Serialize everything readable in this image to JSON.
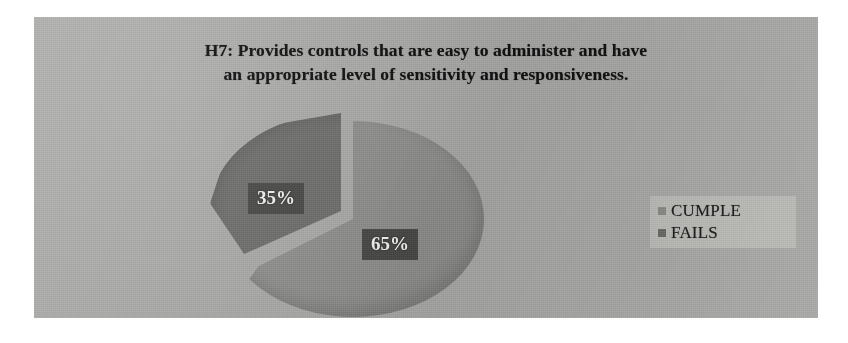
{
  "chart_data": {
    "type": "pie",
    "title": "H7: Provides controls that are easy to administer and have an appropriate level of sensitivity and responsiveness.",
    "title_line1": "H7: Provides controls that are easy to administer and have",
    "title_line2": "an appropriate level of sensitivity and responsiveness.",
    "categories": [
      "CUMPLE",
      "FAILS"
    ],
    "values": [
      65,
      35
    ],
    "value_labels": [
      "65%",
      "35%"
    ],
    "units": "percent",
    "legend": {
      "position": "right",
      "entries": [
        {
          "label": "CUMPLE",
          "color": "#8b8b89",
          "value": 65,
          "value_label": "65%"
        },
        {
          "label": "FAILS",
          "color": "#6b6b69",
          "value": 35,
          "value_label": "35%"
        }
      ]
    },
    "exploded_slice": "FAILS",
    "grid": false,
    "xlabel": "",
    "ylabel": ""
  },
  "colors": {
    "panel_background": "#a8a8a6",
    "slice_cumple": "#8e8e8c",
    "slice_fails": "#6d6d6b",
    "label_box": "#4a4a48",
    "label_text": "#f2f2f0",
    "legend_background": "#b9b9b6",
    "title_text": "#121212"
  }
}
